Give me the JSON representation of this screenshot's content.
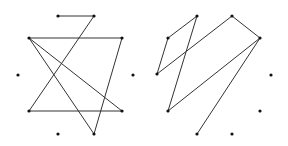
{
  "diagram": {
    "width": 288,
    "height": 146,
    "colors": {
      "edge": "#333333",
      "node": "#111111",
      "background": "#ffffff"
    },
    "node_radius": 1.6,
    "panels": [
      {
        "name": "left-graph",
        "nodes": [
          {
            "id": "a",
            "x": 58,
            "y": 16
          },
          {
            "id": "b",
            "x": 94,
            "y": 16
          },
          {
            "id": "c",
            "x": 29,
            "y": 38
          },
          {
            "id": "d",
            "x": 122,
            "y": 38
          },
          {
            "id": "e",
            "x": 18,
            "y": 75
          },
          {
            "id": "f",
            "x": 133,
            "y": 75
          },
          {
            "id": "g",
            "x": 29,
            "y": 111
          },
          {
            "id": "h",
            "x": 122,
            "y": 111
          },
          {
            "id": "i",
            "x": 58,
            "y": 134
          },
          {
            "id": "j",
            "x": 94,
            "y": 134
          }
        ],
        "edges": [
          [
            "a",
            "b"
          ],
          [
            "b",
            "g"
          ],
          [
            "c",
            "d"
          ],
          [
            "c",
            "h"
          ],
          [
            "c",
            "j"
          ],
          [
            "d",
            "j"
          ],
          [
            "g",
            "h"
          ]
        ]
      },
      {
        "name": "right-graph",
        "nodes": [
          {
            "id": "p1",
            "x": 197,
            "y": 16
          },
          {
            "id": "p2",
            "x": 232,
            "y": 16
          },
          {
            "id": "p3",
            "x": 168,
            "y": 38
          },
          {
            "id": "p4",
            "x": 260,
            "y": 38
          },
          {
            "id": "p5",
            "x": 157,
            "y": 74
          },
          {
            "id": "p6",
            "x": 271,
            "y": 75
          },
          {
            "id": "p7",
            "x": 168,
            "y": 111
          },
          {
            "id": "p8",
            "x": 260,
            "y": 111
          },
          {
            "id": "p9",
            "x": 197,
            "y": 134
          },
          {
            "id": "p10",
            "x": 232,
            "y": 134
          }
        ],
        "edges": [
          [
            "p1",
            "p3"
          ],
          [
            "p1",
            "p7"
          ],
          [
            "p3",
            "p5"
          ],
          [
            "p5",
            "p2"
          ],
          [
            "p2",
            "p4"
          ],
          [
            "p4",
            "p7"
          ],
          [
            "p4",
            "p9"
          ]
        ]
      }
    ]
  }
}
